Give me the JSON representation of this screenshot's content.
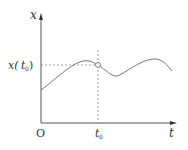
{
  "diagram": {
    "type": "function-plot",
    "labels": {
      "y_axis": "x",
      "x_axis": "t",
      "origin": "O",
      "t0_main": "t",
      "t0_sub": "0",
      "xt0_prefix": "x(",
      "xt0_t": "t",
      "xt0_sub": "0",
      "xt0_suffix": ")"
    },
    "colors": {
      "axis": "#555555",
      "curve": "#777777",
      "dashed": "#888888",
      "text": "#333333"
    },
    "curve_points": [
      [
        41,
        90
      ],
      [
        60,
        76
      ],
      [
        83,
        61
      ],
      [
        98,
        65
      ],
      [
        117,
        76
      ],
      [
        135,
        65
      ],
      [
        153,
        59
      ],
      [
        172,
        71
      ]
    ],
    "marker": {
      "x": 98,
      "y": 65,
      "r": 2.5
    },
    "guides": {
      "vertical_x": 98,
      "vertical_top": 50,
      "vertical_bottom": 123,
      "horizontal_y": 65,
      "horizontal_left": 41,
      "horizontal_right": 98
    }
  }
}
